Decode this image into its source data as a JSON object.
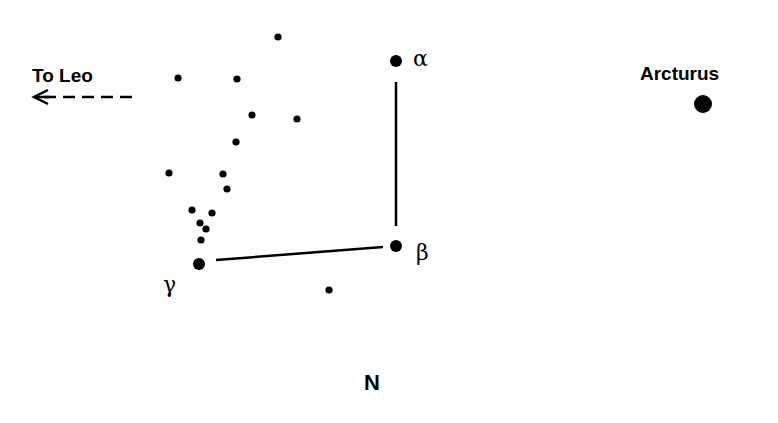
{
  "diagram": {
    "type": "star-chart",
    "ink_color": "#000000",
    "background": "#ffffff",
    "labels": {
      "to_leo": "To Leo",
      "arcturus": "Arcturus",
      "alpha": "α",
      "beta": "β",
      "gamma": "γ",
      "direction": "N"
    },
    "named_stars": [
      {
        "name": "alpha",
        "x": 396,
        "y": 61,
        "r": 6
      },
      {
        "name": "beta",
        "x": 396,
        "y": 246,
        "r": 6
      },
      {
        "name": "gamma",
        "x": 199,
        "y": 264,
        "r": 6
      },
      {
        "name": "arcturus",
        "x": 703,
        "y": 104,
        "r": 9
      }
    ],
    "minor_stars": [
      {
        "x": 278,
        "y": 37
      },
      {
        "x": 178,
        "y": 78
      },
      {
        "x": 237,
        "y": 79
      },
      {
        "x": 252,
        "y": 115
      },
      {
        "x": 297,
        "y": 119
      },
      {
        "x": 236,
        "y": 142
      },
      {
        "x": 169,
        "y": 173
      },
      {
        "x": 223,
        "y": 174
      },
      {
        "x": 227,
        "y": 189
      },
      {
        "x": 192,
        "y": 210
      },
      {
        "x": 212,
        "y": 213
      },
      {
        "x": 200,
        "y": 223
      },
      {
        "x": 206,
        "y": 229
      },
      {
        "x": 201,
        "y": 240
      },
      {
        "x": 329,
        "y": 290
      }
    ],
    "lines": [
      {
        "from": "alpha",
        "to": "beta",
        "x1": 396,
        "y1": 82,
        "x2": 396,
        "y2": 226
      },
      {
        "from": "gamma",
        "to": "beta",
        "x1": 216,
        "y1": 260,
        "x2": 383,
        "y2": 247
      }
    ],
    "arrow": {
      "direction": "left",
      "style": "dashed",
      "x1": 132,
      "x2": 32,
      "y": 97
    }
  }
}
